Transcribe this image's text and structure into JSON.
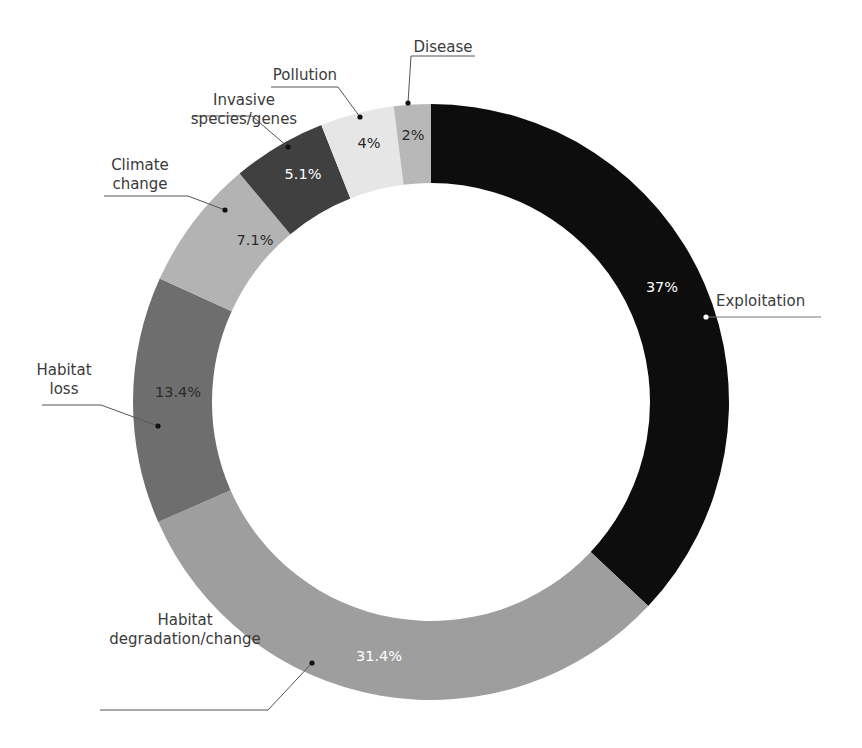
{
  "chart_data": {
    "type": "pie",
    "variant": "donut",
    "title": "",
    "start_angle_deg": 0,
    "direction": "clockwise",
    "categories": [
      "Exploitation",
      "Habitat degradation/change",
      "Habitat loss",
      "Climate change",
      "Invasive species/genes",
      "Pollution",
      "Disease"
    ],
    "values": [
      37,
      31.4,
      13.4,
      7.1,
      5.1,
      4,
      2
    ],
    "value_labels": [
      "37%",
      "31.4%",
      "13.4%",
      "7.1%",
      "5.1%",
      "4%",
      "2%"
    ],
    "colors": [
      "#0d0d0d",
      "#9e9e9e",
      "#6e6e6e",
      "#b3b3b3",
      "#404040",
      "#e6e6e6",
      "#b8b8b8"
    ],
    "label_colors": [
      "#ffffff",
      "#ffffff",
      "#2a2a2a",
      "#2a2a2a",
      "#ffffff",
      "#2a2a2a",
      "#2a2a2a"
    ],
    "legend": "none (callout labels with leader lines)",
    "center": [
      431,
      402
    ],
    "outer_radius": 298,
    "inner_radius": 219,
    "slices": [
      {
        "name": "Exploitation",
        "lines": [
          "Exploitation"
        ],
        "pct": "37%",
        "pct_pos": [
          662,
          292
        ],
        "dot": [
          706,
          317
        ],
        "label_pos": [
          716,
          306
        ],
        "label_anchor": "start",
        "underline": [
          [
            706,
            317
          ],
          [
            821,
            317
          ]
        ]
      },
      {
        "name": "Habitat degradation/change",
        "lines": [
          "Habitat",
          "degradation/change"
        ],
        "pct": "31.4%",
        "pct_pos": [
          379,
          661
        ],
        "dot": [
          312,
          663
        ],
        "label_pos": [
          185,
          644
        ],
        "label_anchor": "middle",
        "underline": [
          [
            312,
            663
          ],
          [
            268,
            710
          ],
          [
            100,
            710
          ]
        ]
      },
      {
        "name": "Habitat loss",
        "lines": [
          "Habitat",
          "loss"
        ],
        "pct": "13.4%",
        "pct_pos": [
          178,
          397
        ],
        "dot": [
          158,
          426
        ],
        "label_pos": [
          64,
          394
        ],
        "label_anchor": "middle",
        "underline": [
          [
            158,
            426
          ],
          [
            101,
            405
          ],
          [
            42,
            405
          ]
        ]
      },
      {
        "name": "Climate change",
        "lines": [
          "Climate",
          "change"
        ],
        "pct": "7.1%",
        "pct_pos": [
          255,
          245
        ],
        "dot": [
          225,
          210
        ],
        "label_pos": [
          140,
          189
        ],
        "label_anchor": "middle",
        "underline": [
          [
            225,
            210
          ],
          [
            188,
            196
          ],
          [
            104,
            196
          ]
        ]
      },
      {
        "name": "Invasive species/genes",
        "lines": [
          "Invasive",
          "species/genes"
        ],
        "pct": "5.1%",
        "pct_pos": [
          303,
          179
        ],
        "dot": [
          288,
          147
        ],
        "label_pos": [
          244,
          124
        ],
        "label_anchor": "middle",
        "underline": [
          [
            288,
            147
          ],
          [
            252,
            116
          ],
          [
            192,
            116
          ]
        ]
      },
      {
        "name": "Pollution",
        "lines": [
          "Pollution"
        ],
        "pct": "4%",
        "pct_pos": [
          369,
          148
        ],
        "dot": [
          360,
          117
        ],
        "label_pos": [
          305,
          80
        ],
        "label_anchor": "middle",
        "underline": [
          [
            360,
            117
          ],
          [
            338,
            87
          ],
          [
            271,
            87
          ]
        ]
      },
      {
        "name": "Disease",
        "lines": [
          "Disease"
        ],
        "pct": "2%",
        "pct_pos": [
          413,
          140
        ],
        "dot": [
          408,
          103
        ],
        "label_pos": [
          443,
          52
        ],
        "label_anchor": "middle",
        "underline": [
          [
            408,
            103
          ],
          [
            411,
            56
          ],
          [
            475,
            56
          ]
        ]
      }
    ]
  }
}
